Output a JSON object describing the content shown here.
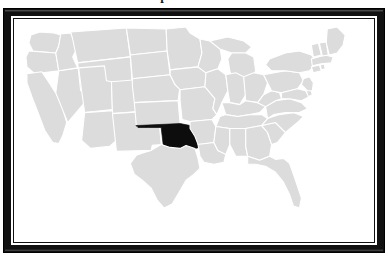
{
  "page": {
    "title": "Map of Oklahoma",
    "background_color": "#ffffff"
  },
  "frame": {
    "name": "picture-frame",
    "outer_color": "#111111",
    "mat_color": "#ffffff",
    "inner_line_color": "#111111"
  },
  "map": {
    "name": "united-states-map",
    "projection": "albers-usa",
    "state_fill": "#dcdcdc",
    "state_border": "#ffffff",
    "highlight_fill": "#0d0d0d",
    "background": "#ffffff",
    "highlighted_state": "Oklahoma",
    "highlighted_state_abbr": "OK",
    "region_note": "contiguous 48 states",
    "states": [
      "Washington",
      "Oregon",
      "California",
      "Nevada",
      "Idaho",
      "Montana",
      "Wyoming",
      "Utah",
      "Arizona",
      "Colorado",
      "New Mexico",
      "North Dakota",
      "South Dakota",
      "Nebraska",
      "Kansas",
      "Oklahoma",
      "Texas",
      "Minnesota",
      "Iowa",
      "Missouri",
      "Arkansas",
      "Louisiana",
      "Wisconsin",
      "Illinois",
      "Michigan",
      "Indiana",
      "Ohio",
      "Kentucky",
      "Tennessee",
      "Mississippi",
      "Alabama",
      "Georgia",
      "Florida",
      "South Carolina",
      "North Carolina",
      "Virginia",
      "West Virginia",
      "Pennsylvania",
      "New York",
      "Maryland",
      "Delaware",
      "New Jersey",
      "Connecticut",
      "Rhode Island",
      "Massachusetts",
      "Vermont",
      "New Hampshire",
      "Maine"
    ]
  }
}
